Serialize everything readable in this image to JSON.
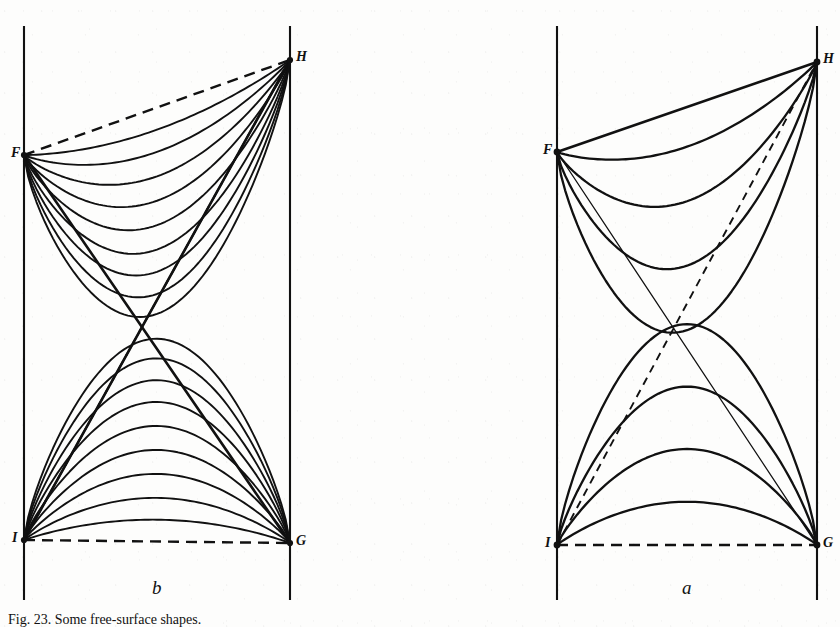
{
  "figure": {
    "caption": "Fig. 23. Some free-surface shapes.",
    "background_color": "#fdfdfc",
    "ink_color": "#111111",
    "width": 840,
    "height": 627
  },
  "panels": [
    {
      "id": "b",
      "label": "b",
      "label_position": {
        "x": 152,
        "y": 578
      },
      "description": "Dense family of nested curves inside two opposed triangles; bounding chords F-H and I-G drawn dashed.",
      "vertices": [
        {
          "name": "F",
          "label": "F",
          "x": 24,
          "y": 155,
          "label_x": 11,
          "label_y": 146
        },
        {
          "name": "H",
          "label": "H",
          "x": 290,
          "y": 60,
          "label_x": 296,
          "label_y": 50
        },
        {
          "name": "I",
          "label": "I",
          "x": 24,
          "y": 540,
          "label_x": 12,
          "label_y": 531
        },
        {
          "name": "G",
          "label": "G",
          "x": 290,
          "y": 543,
          "label_x": 296,
          "label_y": 534
        }
      ],
      "rails": [
        {
          "name": "left-rail",
          "x": 24,
          "y1": 26,
          "y2": 600
        },
        {
          "name": "right-rail",
          "x": 290,
          "y1": 26,
          "y2": 600
        }
      ],
      "chords": [
        {
          "name": "F-H",
          "style": "dashed",
          "from": "F",
          "to": "H"
        },
        {
          "name": "I-G",
          "style": "dashed",
          "from": "I",
          "to": "G"
        },
        {
          "name": "F-G",
          "style": "solid",
          "from": "F",
          "to": "G"
        },
        {
          "name": "I-H",
          "style": "solid",
          "from": "I",
          "to": "H"
        }
      ],
      "crossing_point": {
        "x": 143,
        "y": 330
      },
      "upper_family_count": 9,
      "lower_family_count": 9
    },
    {
      "id": "a",
      "label": "a",
      "label_position": {
        "x": 682,
        "y": 578
      },
      "description": "Sparse family of four smooth sagging/arching curves spanning F-H and I-G; straight chords drawn solid, extensions dashed.",
      "vertices": [
        {
          "name": "F",
          "label": "F",
          "x": 557,
          "y": 152,
          "label_x": 543,
          "label_y": 143
        },
        {
          "name": "H",
          "label": "H",
          "x": 817,
          "y": 62,
          "label_x": 823,
          "label_y": 52
        },
        {
          "name": "I",
          "label": "I",
          "x": 557,
          "y": 545,
          "label_x": 545,
          "label_y": 536
        },
        {
          "name": "G",
          "label": "G",
          "x": 817,
          "y": 545,
          "label_x": 823,
          "label_y": 536
        }
      ],
      "rails": [
        {
          "name": "left-rail",
          "x": 557,
          "y1": 26,
          "y2": 600
        },
        {
          "name": "right-rail",
          "x": 817,
          "y1": 26,
          "y2": 600
        }
      ],
      "chords": [
        {
          "name": "F-H",
          "style": "solid",
          "from": "F",
          "to": "H"
        },
        {
          "name": "I-G",
          "style": "dashed",
          "from": "I",
          "to": "G"
        },
        {
          "name": "F-G",
          "style": "solid-thin",
          "from": "F",
          "to": "G"
        },
        {
          "name": "I-H",
          "style": "dashed-fine",
          "from": "I",
          "to": "H"
        }
      ],
      "crossing_point": {
        "x": 687,
        "y": 345
      },
      "upper_family_count": 4,
      "lower_family_count": 4
    }
  ],
  "chart_data": {
    "type": "line",
    "xlabel": "",
    "ylabel": "",
    "grid": false,
    "legend": "none",
    "notes": [
      "Panel b: two triangles (F-H-crossing and I-G-crossing) each filled with nine nested curves that are tangent to the straight chords near the corners.",
      "Panel a: four curves sag from F to H and four curves arch from I to G, with monotonically increasing deflection."
    ],
    "series": [
      {
        "name": "panel-b-upper",
        "panel": "b",
        "anchor_from": "F",
        "anchor_to": "H",
        "orientation": "sagging",
        "count": 9,
        "sag_fractions": [
          0.1,
          0.2,
          0.31,
          0.42,
          0.53,
          0.64,
          0.74,
          0.84,
          0.93
        ]
      },
      {
        "name": "panel-b-lower",
        "panel": "b",
        "anchor_from": "I",
        "anchor_to": "G",
        "orientation": "arching",
        "count": 9,
        "sag_fractions": [
          0.1,
          0.2,
          0.31,
          0.42,
          0.53,
          0.64,
          0.74,
          0.84,
          0.93
        ]
      },
      {
        "name": "panel-a-upper",
        "panel": "a",
        "anchor_from": "F",
        "anchor_to": "H",
        "orientation": "sagging",
        "count": 4,
        "sag_fractions": [
          0.16,
          0.38,
          0.64,
          0.9
        ]
      },
      {
        "name": "panel-a-lower",
        "panel": "a",
        "anchor_from": "I",
        "anchor_to": "G",
        "orientation": "arching",
        "count": 4,
        "sag_fractions": [
          0.18,
          0.4,
          0.66,
          0.92
        ]
      }
    ]
  }
}
